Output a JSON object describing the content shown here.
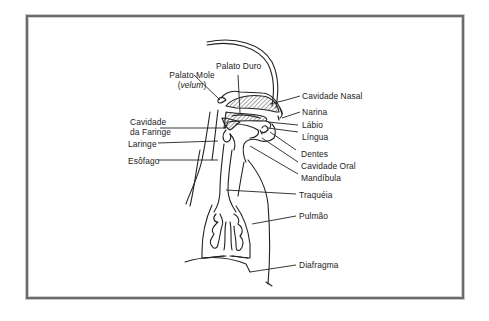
{
  "diagram": {
    "type": "anatomical-line-drawing",
    "labels": {
      "palato_duro": "Palato Duro",
      "palato_mole": "Palato Mole",
      "velum_open": "(",
      "velum": "velum",
      "velum_close": ")",
      "cavidade_nasal": "Cavidade Nasal",
      "narina": "Narina",
      "labio": "Lábio",
      "lingua": "Língua",
      "cavidade_faringe_1": "Cavidade",
      "cavidade_faringe_2": "da Faringe",
      "laringe": "Laringe",
      "esofago": "Esôfago",
      "dentes": "Dentes",
      "cavidade_oral": "Cavidade Oral",
      "mandibula": "Mandíbula",
      "traqueia": "Traquéia",
      "pulmao": "Pulmão",
      "diafragma": "Diafragma"
    },
    "colors": {
      "line": "#222222",
      "frame": "#6b6b6b",
      "background": "#ffffff"
    }
  }
}
